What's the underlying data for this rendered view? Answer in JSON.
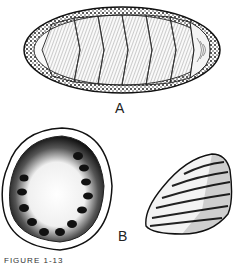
{
  "figure": {
    "labels": {
      "a": "A",
      "b": "B"
    },
    "caption": "FIGURE 1-13",
    "panels": [
      {
        "id": "A",
        "subject": "chiton-dorsal-view",
        "plates": 8
      },
      {
        "id": "B",
        "subject": "limpet-shell-interior-and-exterior"
      }
    ],
    "colors": {
      "ink": "#1a1a1a",
      "paper": "#ffffff"
    }
  }
}
